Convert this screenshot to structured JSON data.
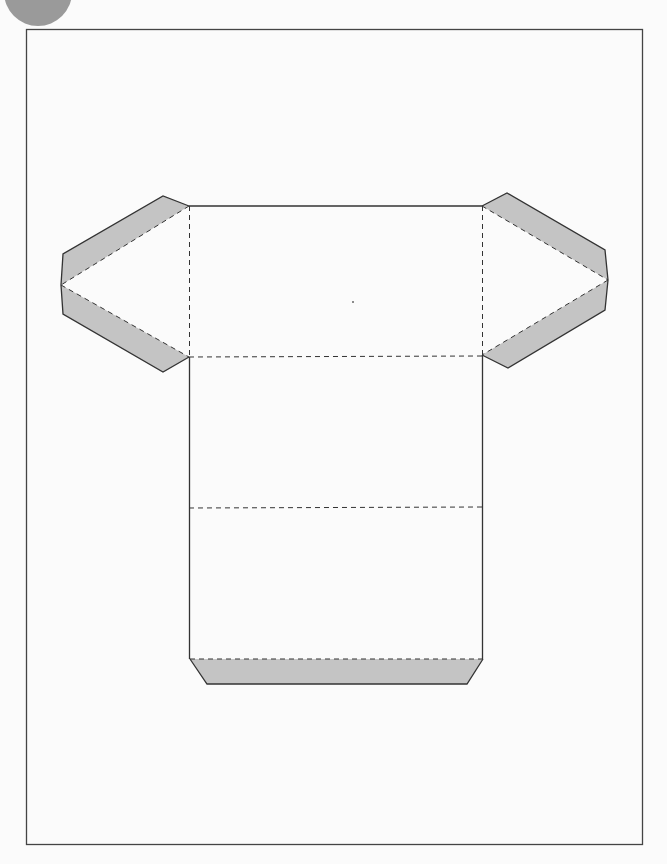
{
  "diagram": {
    "title": "",
    "type": "net-template",
    "colors": {
      "background": "#fbfbfb",
      "frame": "#444444",
      "outline": "#333333",
      "fold_line": "#333333",
      "tab_fill": "#c4c4c4",
      "corner_circle": "#9a9a9a"
    },
    "frame": {
      "x": 26,
      "y": 29,
      "width": 617,
      "height": 816
    },
    "body": {
      "x": 189,
      "y": 206,
      "width": 293,
      "height": 453
    },
    "fold_lines": [
      {
        "name": "top-fold",
        "y": 357
      },
      {
        "name": "middle-fold",
        "y": 508
      },
      {
        "name": "bottom-tab-fold",
        "y": 659
      }
    ],
    "flaps": [
      {
        "name": "left-flap",
        "shaded": true
      },
      {
        "name": "right-flap",
        "shaded": true
      },
      {
        "name": "bottom-tab",
        "shaded": true
      }
    ]
  }
}
